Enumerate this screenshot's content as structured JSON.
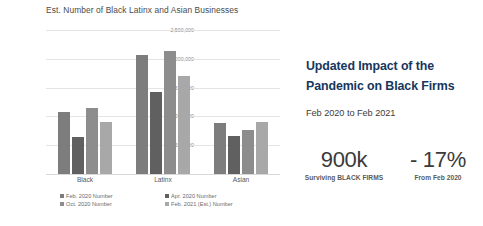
{
  "chart_data": {
    "type": "bar",
    "title": "Est. Number of Black Latinx and Asian Businesses",
    "xlabel": "",
    "ylabel": "",
    "categories": [
      "Black",
      "Latinx",
      "Asian"
    ],
    "series": [
      {
        "name": "Feb. 2020 Number",
        "color": "#7d7d7d",
        "values": [
          1080000,
          2060000,
          890000
        ]
      },
      {
        "name": "Apr. 2020 Number",
        "color": "#606060",
        "values": [
          640000,
          1430000,
          660000
        ]
      },
      {
        "name": "Oct. 2020 Number",
        "color": "#8d8d8d",
        "values": [
          1150000,
          2130000,
          760000
        ]
      },
      {
        "name": "Feb. 2021 (Est.) Number",
        "color": "#a8a8a8",
        "values": [
          900000,
          1700000,
          900000
        ]
      }
    ],
    "ylim": [
      0,
      2500000
    ],
    "ytick_labels": [
      "2,500,000",
      "2,000,000",
      "1,500,000",
      "1,000,000",
      "500,000",
      "-"
    ],
    "ytick_values": [
      2500000,
      2000000,
      1500000,
      1000000,
      500000,
      0
    ],
    "grid": true,
    "legend_position": "bottom"
  },
  "callout": {
    "headline": "Updated Impact of the Pandemic on Black Firms",
    "subhead": "Feb 2020 to Feb 2021",
    "headline_color": "#17365d",
    "stats": [
      {
        "value": "900k",
        "label": "Surviving BLACK FIRMS"
      },
      {
        "value": "- 17%",
        "label": "From Feb 2020"
      }
    ]
  }
}
